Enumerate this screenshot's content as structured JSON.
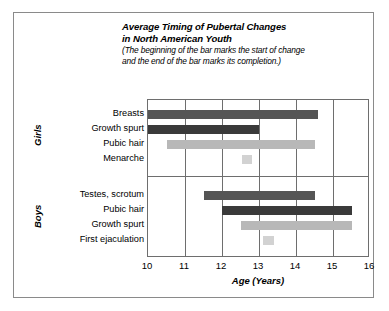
{
  "figure": {
    "title_lines": [
      "Average Timing of Pubertal Changes",
      "in North American Youth"
    ],
    "subtitle_lines": [
      "(The beginning of the bar marks the start of change",
      "and the end of the bar marks its completion.)"
    ],
    "frame_color": "#8a8a8a",
    "axis_color": "#6e6e6e"
  },
  "chart_data": {
    "type": "bar",
    "orientation": "horizontal",
    "title": "Average Timing of Pubertal Changes in North American Youth",
    "subtitle": "(The beginning of the bar marks the start of change and the end of the bar marks its completion.)",
    "xlabel": "Age (Years)",
    "ylabel": "",
    "xlim": [
      10,
      16
    ],
    "xticks": [
      10,
      11,
      12,
      13,
      14,
      15,
      16
    ],
    "xtick_labels": [
      "10",
      "11",
      "12",
      "13",
      "14",
      "15",
      "16"
    ],
    "grid": true,
    "legend": "none",
    "note": "Each bar is a range bar: start age to end age.",
    "groups": [
      {
        "name": "Girls",
        "categories": [
          {
            "label": "Breasts",
            "start": 10.0,
            "end": 14.6,
            "color": "#555555"
          },
          {
            "label": "Growth spurt",
            "start": 10.0,
            "end": 13.0,
            "color": "#3a3a3a"
          },
          {
            "label": "Pubic hair",
            "start": 10.5,
            "end": 14.5,
            "color": "#b8b8b8"
          },
          {
            "label": "Menarche",
            "start": 12.55,
            "end": 12.8,
            "color": "#d2d2d2"
          }
        ]
      },
      {
        "name": "Boys",
        "categories": [
          {
            "label": "Testes, scrotum",
            "start": 11.5,
            "end": 14.5,
            "color": "#555555"
          },
          {
            "label": "Pubic hair",
            "start": 12.0,
            "end": 15.5,
            "color": "#3a3a3a"
          },
          {
            "label": "Growth spurt",
            "start": 12.5,
            "end": 15.5,
            "color": "#b8b8b8"
          },
          {
            "label": "First ejaculation",
            "start": 13.1,
            "end": 13.4,
            "color": "#d2d2d2"
          }
        ]
      }
    ]
  }
}
